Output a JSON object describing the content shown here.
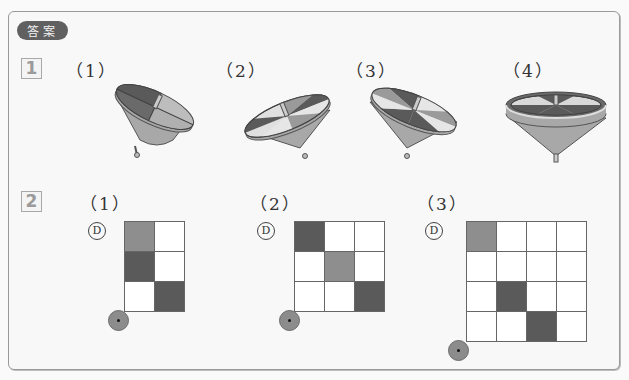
{
  "header": {
    "badge": "答案"
  },
  "section1": {
    "number": "1",
    "items": [
      {
        "label": "（1）",
        "figure": "spinning-top-1"
      },
      {
        "label": "（2）",
        "figure": "spinning-top-2"
      },
      {
        "label": "（3）",
        "figure": "spinning-top-3"
      },
      {
        "label": "（4）",
        "figure": "spinning-top-4"
      }
    ]
  },
  "section2": {
    "number": "2",
    "d_mark": "D",
    "items": [
      {
        "label": "（1）",
        "cols": 2,
        "rows": 3,
        "cells": [
          [
            "mid",
            "white"
          ],
          [
            "dark",
            "white"
          ],
          [
            "white",
            "dark"
          ]
        ]
      },
      {
        "label": "（2）",
        "cols": 3,
        "rows": 3,
        "cells": [
          [
            "dark",
            "white",
            "white"
          ],
          [
            "white",
            "mid",
            "white"
          ],
          [
            "white",
            "white",
            "dark"
          ]
        ]
      },
      {
        "label": "（3）",
        "cols": 4,
        "rows": 4,
        "cells": [
          [
            "mid",
            "white",
            "white",
            "white"
          ],
          [
            "white",
            "white",
            "white",
            "white"
          ],
          [
            "white",
            "dark",
            "white",
            "white"
          ],
          [
            "white",
            "white",
            "dark",
            "white"
          ]
        ]
      }
    ]
  },
  "colors": {
    "dark": "#5a5a5a",
    "mid": "#8e8e8e",
    "light": "#d9d9d9",
    "body": "#a8a8a8"
  }
}
